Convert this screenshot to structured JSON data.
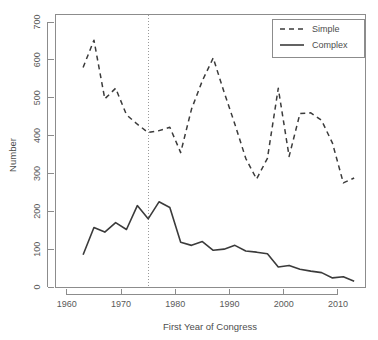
{
  "chart_data": {
    "type": "line",
    "title": "",
    "xlabel": "First Year of Congress",
    "ylabel": "Number",
    "xlim": [
      1958,
      2015
    ],
    "ylim": [
      0,
      720
    ],
    "xticks": [
      1960,
      1970,
      1980,
      1990,
      2000,
      2010
    ],
    "xtick_labels": [
      "1960",
      "1970",
      "1980",
      "1990",
      "2000",
      "2010"
    ],
    "yticks": [
      0,
      100,
      200,
      300,
      400,
      500,
      600,
      700
    ],
    "ytick_labels": [
      "0",
      "100",
      "200",
      "300",
      "400",
      "500",
      "600",
      "700"
    ],
    "grid": false,
    "legend_position": "top-right",
    "x": [
      1963,
      1965,
      1967,
      1969,
      1971,
      1973,
      1975,
      1977,
      1979,
      1981,
      1983,
      1985,
      1987,
      1989,
      1991,
      1993,
      1995,
      1997,
      1999,
      2001,
      2003,
      2005,
      2007,
      2009,
      2011,
      2013
    ],
    "series": [
      {
        "name": "Simple",
        "style": "dashed",
        "color": "#3b3b3b",
        "values": [
          580,
          652,
          497,
          525,
          455,
          430,
          408,
          413,
          422,
          355,
          470,
          545,
          605,
          515,
          430,
          340,
          285,
          340,
          525,
          345,
          458,
          460,
          440,
          380,
          275,
          288
        ]
      },
      {
        "name": "Complex",
        "style": "solid",
        "color": "#3b3b3b",
        "values": [
          85,
          157,
          145,
          170,
          152,
          215,
          180,
          225,
          210,
          118,
          110,
          120,
          97,
          100,
          110,
          95,
          92,
          88,
          53,
          57,
          47,
          42,
          38,
          24,
          27,
          15
        ]
      }
    ],
    "annotations": [
      {
        "name": "reference-line",
        "type": "vline",
        "x": 1975,
        "style": "dotted"
      }
    ]
  },
  "legend": {
    "entries": [
      {
        "label": "Simple",
        "style": "dashed"
      },
      {
        "label": "Complex",
        "style": "solid"
      }
    ]
  }
}
